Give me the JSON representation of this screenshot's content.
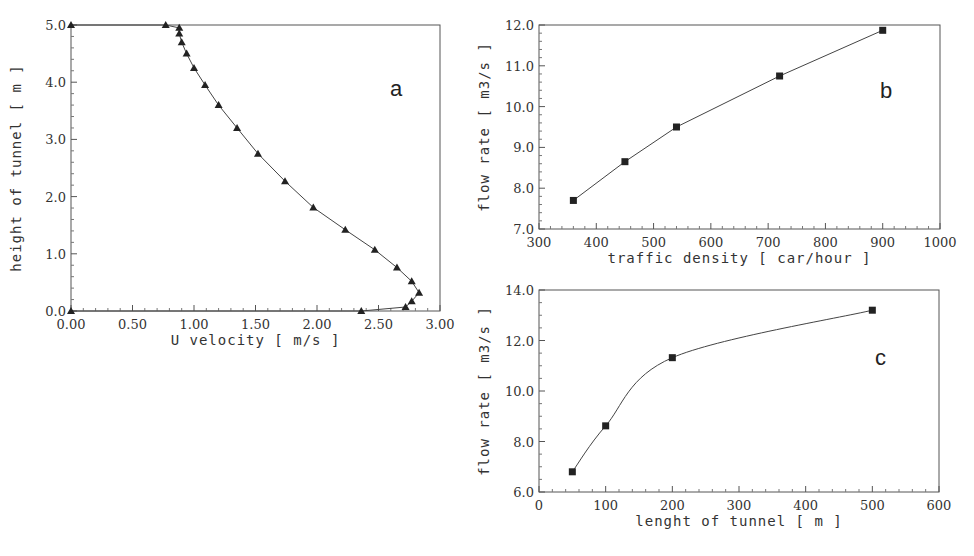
{
  "chart_data": [
    {
      "id": "a",
      "type": "line",
      "panel_label": "a",
      "title": "",
      "xlabel": "U velocity [ m/s ]",
      "ylabel": "height of tunnel [ m ]",
      "xlim": [
        0.0,
        3.0
      ],
      "ylim": [
        0.0,
        5.0
      ],
      "xticks": [
        "0.00",
        "0.50",
        "1.00",
        "1.50",
        "2.00",
        "2.50",
        "3.00"
      ],
      "yticks": [
        "0.0",
        "1.0",
        "2.0",
        "3.0",
        "4.0",
        "5.0"
      ],
      "marker": "triangle",
      "grid": false,
      "x": [
        0.0,
        2.36,
        2.72,
        2.77,
        2.83,
        2.77,
        2.65,
        2.47,
        2.23,
        1.97,
        1.74,
        1.52,
        1.35,
        1.2,
        1.09,
        1.0,
        0.94,
        0.9,
        0.88,
        0.88,
        0.77,
        0.0
      ],
      "y": [
        0.0,
        0.0,
        0.07,
        0.17,
        0.32,
        0.52,
        0.76,
        1.07,
        1.42,
        1.81,
        2.27,
        2.75,
        3.2,
        3.6,
        3.95,
        4.25,
        4.5,
        4.7,
        4.85,
        4.95,
        5.0,
        5.0
      ]
    },
    {
      "id": "b",
      "type": "line",
      "panel_label": "b",
      "title": "",
      "xlabel": "traffic density [ car/hour ]",
      "ylabel": "flow rate [ m3/s ]",
      "xlim": [
        300,
        1000
      ],
      "ylim": [
        7.0,
        12.0
      ],
      "xticks": [
        "300",
        "400",
        "500",
        "600",
        "700",
        "800",
        "900",
        "1000"
      ],
      "yticks": [
        "7.0",
        "8.0",
        "9.0",
        "10.0",
        "11.0",
        "12.0"
      ],
      "marker": "square",
      "grid": false,
      "x": [
        360,
        450,
        540,
        720,
        900
      ],
      "y": [
        7.7,
        8.65,
        9.5,
        10.75,
        11.87
      ]
    },
    {
      "id": "c",
      "type": "line",
      "panel_label": "c",
      "title": "",
      "xlabel": "lenght of tunnel [ m ]",
      "ylabel": "flow rate [ m3/s ]",
      "xlim": [
        0,
        600
      ],
      "ylim": [
        6.0,
        14.0
      ],
      "xticks": [
        "0",
        "100",
        "200",
        "300",
        "400",
        "500",
        "600"
      ],
      "yticks": [
        "6.0",
        "8.0",
        "10.0",
        "12.0",
        "14.0"
      ],
      "marker": "square",
      "grid": false,
      "x": [
        50,
        100,
        200,
        500
      ],
      "y": [
        6.8,
        8.62,
        11.32,
        13.2
      ]
    }
  ]
}
